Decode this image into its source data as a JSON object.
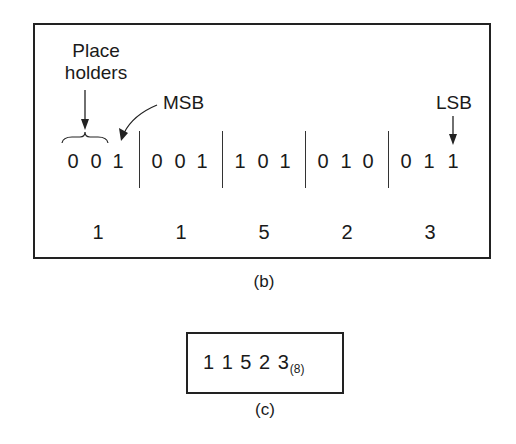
{
  "figure_b": {
    "labels": {
      "place_holders_line1": "Place",
      "place_holders_line2": "holders",
      "msb": "MSB",
      "lsb": "LSB"
    },
    "groups": [
      {
        "bits": [
          "0",
          "0",
          "1"
        ],
        "octal": "1"
      },
      {
        "bits": [
          "0",
          "0",
          "1"
        ],
        "octal": "1"
      },
      {
        "bits": [
          "1",
          "0",
          "1"
        ],
        "octal": "5"
      },
      {
        "bits": [
          "0",
          "1",
          "0"
        ],
        "octal": "2"
      },
      {
        "bits": [
          "0",
          "1",
          "1"
        ],
        "octal": "3"
      }
    ],
    "caption": "(b)"
  },
  "figure_c": {
    "result_digits": "1 1 5 2 3",
    "base_subscript": "(8)",
    "caption": "(c)"
  }
}
